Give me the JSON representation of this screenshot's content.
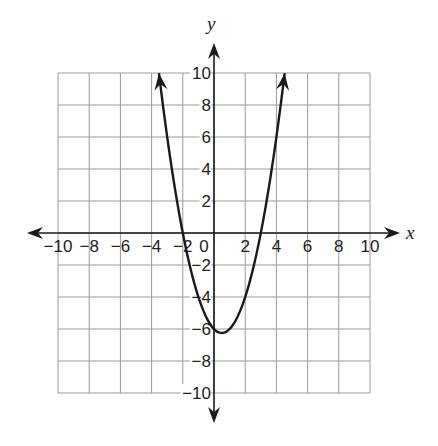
{
  "chart_data": {
    "type": "line",
    "title": "",
    "xlabel": "x",
    "ylabel": "y",
    "xlim": [
      -10,
      10
    ],
    "ylim": [
      -10,
      10
    ],
    "grid": true,
    "grid_step": 2,
    "x_ticks": [
      -10,
      -8,
      -6,
      -4,
      -2,
      0,
      2,
      4,
      6,
      8,
      10
    ],
    "y_ticks": [
      10,
      8,
      6,
      4,
      2,
      -2,
      -4,
      -6,
      -8,
      -10
    ],
    "x_tick_labels": [
      "−10",
      "−8",
      "−6",
      "−4",
      "−2",
      "0",
      "2",
      "4",
      "6",
      "8",
      "10"
    ],
    "y_tick_labels": [
      "10",
      "8",
      "6",
      "4",
      "2",
      "−2",
      "−4",
      "−6",
      "−8",
      "−10"
    ],
    "series": [
      {
        "name": "parabola",
        "equation": "y = x^2 - x - 6",
        "vertex": [
          0.5,
          -6.25
        ],
        "x_intercepts": [
          -2,
          3
        ],
        "y_intercept": -6,
        "x_range": [
          -3.53,
          4.53
        ],
        "arrows_at_ends": true,
        "color": "#1a1a1a"
      }
    ]
  }
}
